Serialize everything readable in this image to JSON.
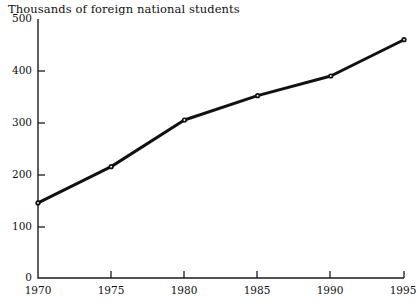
{
  "chart_data": {
    "type": "line",
    "title": "Thousands of foreign national students",
    "xlabel": "",
    "ylabel": "",
    "x": [
      1970,
      1975,
      1980,
      1985,
      1990,
      1995
    ],
    "xtick_labels": [
      "1970",
      "1975",
      "1980",
      "1985",
      "1990",
      "1995"
    ],
    "ytick_labels": [
      "0",
      "100",
      "200",
      "300",
      "400",
      "500"
    ],
    "yticks": [
      0,
      100,
      200,
      300,
      400,
      500
    ],
    "values": [
      145,
      215,
      305,
      352,
      390,
      460
    ],
    "series": [
      {
        "name": "Foreign national students",
        "values": [
          145,
          215,
          305,
          352,
          390,
          460
        ]
      }
    ],
    "xlim": [
      1970,
      1995
    ],
    "ylim": [
      0,
      500
    ],
    "grid": false,
    "legend": "none",
    "line_color": "#111111",
    "marker": "dot"
  }
}
